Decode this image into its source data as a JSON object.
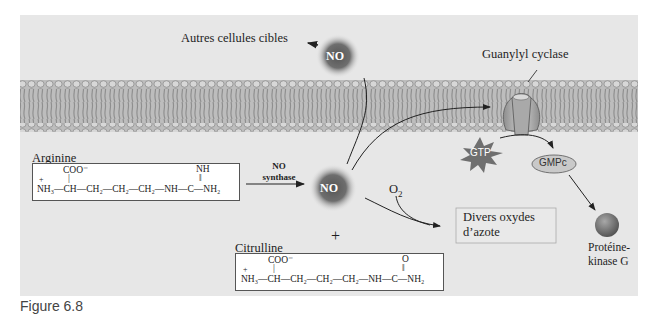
{
  "labels": {
    "other_cells": "Autres cellules cibles",
    "guanylyl_cyclase": "Guanylyl cyclase",
    "no_top": "NO",
    "no_center": "NO",
    "arginine": "Arginine",
    "citrulline": "Citrulline",
    "no_synthase_line1": "NO",
    "no_synthase_line2": "synthase",
    "o2": "O",
    "o2_sub": "2",
    "plus": "+",
    "gtp": "GTP",
    "gmpc": "GMPc",
    "oxides_line1": "Divers oxydes",
    "oxides_line2": "d’azote",
    "pkg_line1": "Protéine-",
    "pkg_line2": "kinase G",
    "caption": "Figure 6.8"
  },
  "arginine_formula": {
    "top_coo": "COO⁻",
    "top_nh": "NH",
    "main": "NH₃—CH—CH₂—CH₂—CH₂—NH—C—NH₂",
    "charge": "+"
  },
  "citrulline_formula": {
    "top_coo": "COO⁻",
    "top_o": "O",
    "main": "NH₃—CH—CH₂—CH₂—CH₂—NH—C—NH₂",
    "charge": "+"
  },
  "colors": {
    "background": "#e7e7e7",
    "membrane": "#b5b5b5",
    "no_sphere": "#6a6a6a",
    "gtp_star": "#6f6f6f",
    "gmpc_fill": "#c8c8c8",
    "kinase_sphere": "#777777"
  }
}
